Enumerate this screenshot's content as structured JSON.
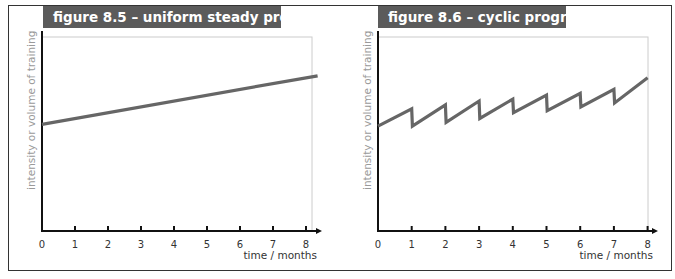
{
  "figures": [
    {
      "title": "figure 8.5 – uniform steady progression",
      "ylabel": "intensity or volume of training",
      "xlabel": "time / months",
      "ticks": [
        "0",
        "1",
        "2",
        "3",
        "4",
        "5",
        "6",
        "7",
        "8"
      ]
    },
    {
      "title": "figure 8.6 – cyclic progression",
      "ylabel": "intensity or volume of training",
      "xlabel": "time / months",
      "ticks": [
        "0",
        "1",
        "2",
        "3",
        "4",
        "5",
        "6",
        "7",
        "8"
      ]
    }
  ],
  "colors": {
    "title_bg": "#5b5b5b",
    "title_text": "#ffffff",
    "line": "#666666",
    "axis": "#111111",
    "ylabel": "#9a9a9a"
  },
  "chart_data": [
    {
      "type": "line",
      "title": "figure 8.5 – uniform steady progression",
      "xlabel": "time / months",
      "ylabel": "intensity or volume of training",
      "x": [
        0,
        8.35
      ],
      "series": [
        {
          "name": "uniform steady progression",
          "values": [
            55,
            80
          ]
        }
      ],
      "xlim": [
        0,
        8.4
      ],
      "ylim": [
        0,
        100
      ],
      "xticks": [
        0,
        1,
        2,
        3,
        4,
        5,
        6,
        7,
        8
      ],
      "yticks": [],
      "grid": false,
      "legend": null,
      "note": "Y values in relative units (no y-axis scale shown); linear rise from ~55% to ~80% of axis height"
    },
    {
      "type": "line",
      "title": "figure 8.6 – cyclic progression",
      "xlabel": "time / months",
      "ylabel": "intensity or volume of training",
      "x": [
        0,
        1,
        1.02,
        2,
        2.02,
        3,
        3.02,
        4,
        4.02,
        5,
        5.02,
        6,
        6.02,
        7,
        7.02,
        8
      ],
      "series": [
        {
          "name": "cyclic progression",
          "values": [
            54,
            63,
            54,
            65,
            56,
            67,
            58,
            68,
            61,
            70,
            62,
            71,
            64,
            73,
            66,
            79
          ]
        }
      ],
      "xlim": [
        0,
        8.4
      ],
      "ylim": [
        0,
        100
      ],
      "xticks": [
        0,
        1,
        2,
        3,
        4,
        5,
        6,
        7,
        8
      ],
      "yticks": [],
      "grid": false,
      "legend": null,
      "note": "Sawtooth: gradual rise each month followed by a sharp drop; overall upward trend. Y values in relative units."
    }
  ]
}
